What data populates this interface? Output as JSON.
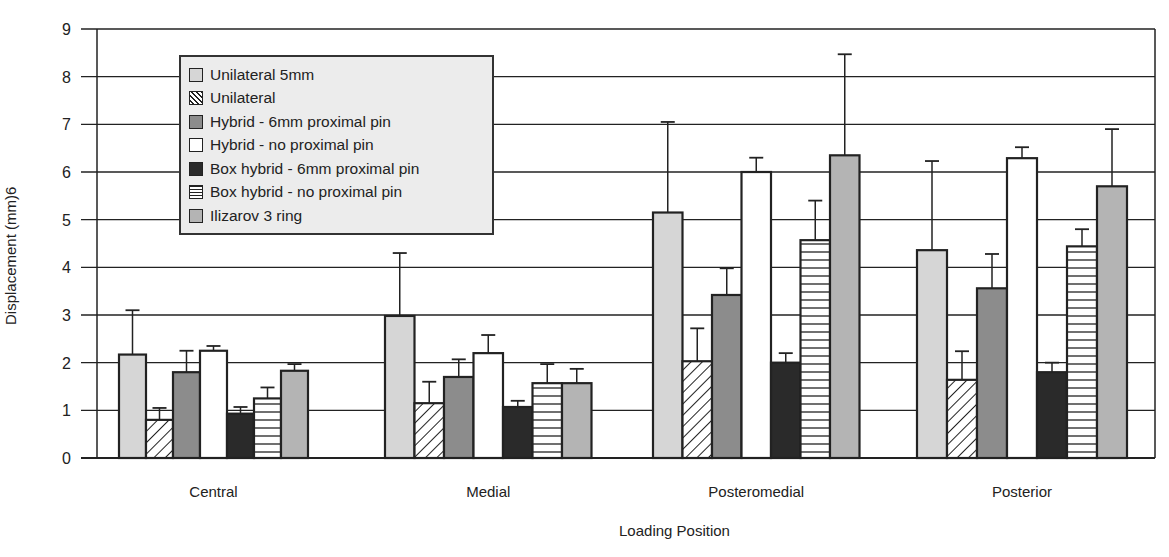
{
  "chart_data": {
    "type": "bar",
    "title": "",
    "xlabel": "Loading Position",
    "ylabel": "Displacement (mm)6",
    "ylim": [
      0,
      9
    ],
    "yticks": [
      0,
      1,
      2,
      3,
      4,
      5,
      6,
      7,
      8,
      9
    ],
    "grid": true,
    "legend_position": "upper left (inside)",
    "categories": [
      "Central",
      "Medial",
      "Posteromedial",
      "Posterior"
    ],
    "series": [
      {
        "name": "Unilateral 5mm",
        "fill": "light-gray",
        "values": [
          2.17,
          2.98,
          5.15,
          4.36
        ],
        "error_upper": [
          3.1,
          4.3,
          7.05,
          6.23
        ]
      },
      {
        "name": "Unilateral",
        "fill": "diagonal-hatch",
        "values": [
          0.8,
          1.15,
          2.03,
          1.64
        ],
        "error_upper": [
          1.05,
          1.6,
          2.72,
          2.24
        ]
      },
      {
        "name": "Hybrid - 6mm proximal pin",
        "fill": "medium-gray",
        "values": [
          1.8,
          1.7,
          3.42,
          3.56
        ],
        "error_upper": [
          2.25,
          2.07,
          3.98,
          4.28
        ]
      },
      {
        "name": "Hybrid - no proximal pin",
        "fill": "white",
        "values": [
          2.25,
          2.2,
          6.0,
          6.29
        ],
        "error_upper": [
          2.35,
          2.58,
          6.3,
          6.52
        ]
      },
      {
        "name": "Box hybrid - 6mm proximal pin",
        "fill": "dark",
        "values": [
          0.93,
          1.07,
          2.0,
          1.8
        ],
        "error_upper": [
          1.07,
          1.2,
          2.2,
          2.0
        ]
      },
      {
        "name": "Box hybrid - no proximal pin",
        "fill": "horizontal-lines",
        "values": [
          1.25,
          1.57,
          4.57,
          4.44
        ],
        "error_upper": [
          1.48,
          1.97,
          5.4,
          4.8
        ]
      },
      {
        "name": "Ilizarov 3 ring",
        "fill": "gray",
        "values": [
          1.83,
          1.57,
          6.35,
          5.7
        ],
        "error_upper": [
          1.97,
          1.87,
          8.47,
          6.9
        ]
      }
    ]
  },
  "colors": {
    "light-gray": "#d6d6d6",
    "medium-gray": "#8c8c8c",
    "white": "#ffffff",
    "dark": "#2a2a2a",
    "gray": "#b4b4b4",
    "hatch-bg": "#ffffff",
    "line": "#222222",
    "legend-bg": "#ececec"
  }
}
